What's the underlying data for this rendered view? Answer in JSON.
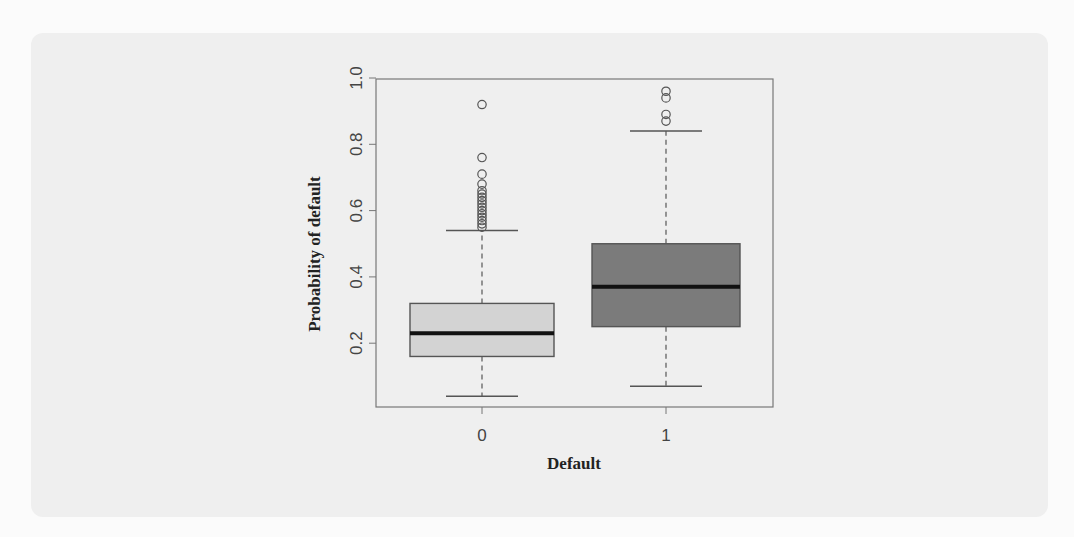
{
  "chart_data": {
    "type": "boxplot",
    "title": "",
    "xlabel": "Default",
    "ylabel": "Probability of default",
    "ylim": [
      0.0,
      1.0
    ],
    "yticks": [
      0.2,
      0.4,
      0.6,
      0.8,
      1.0
    ],
    "ytick_labels": [
      "0.2",
      "0.4",
      "0.6",
      "0.8",
      "1.0"
    ],
    "categories": [
      "0",
      "1"
    ],
    "grid": false,
    "legend": null,
    "series": [
      {
        "name": "0",
        "fill": "#d3d3d3",
        "whisker_low": 0.04,
        "q1": 0.16,
        "median": 0.23,
        "q3": 0.32,
        "whisker_high": 0.54,
        "outliers": [
          0.92,
          0.76,
          0.71,
          0.68,
          0.66,
          0.65,
          0.64,
          0.63,
          0.62,
          0.61,
          0.6,
          0.59,
          0.58,
          0.57,
          0.56,
          0.55
        ]
      },
      {
        "name": "1",
        "fill": "#7b7b7b",
        "whisker_low": 0.07,
        "q1": 0.25,
        "median": 0.37,
        "q3": 0.5,
        "whisker_high": 0.84,
        "outliers": [
          0.96,
          0.94,
          0.89,
          0.87
        ]
      }
    ]
  },
  "colors": {
    "panel_background": "#efefef",
    "page_background": "#fbfbfb",
    "axis_line": "#777777",
    "box_border": "#555555",
    "median": "#111111"
  }
}
